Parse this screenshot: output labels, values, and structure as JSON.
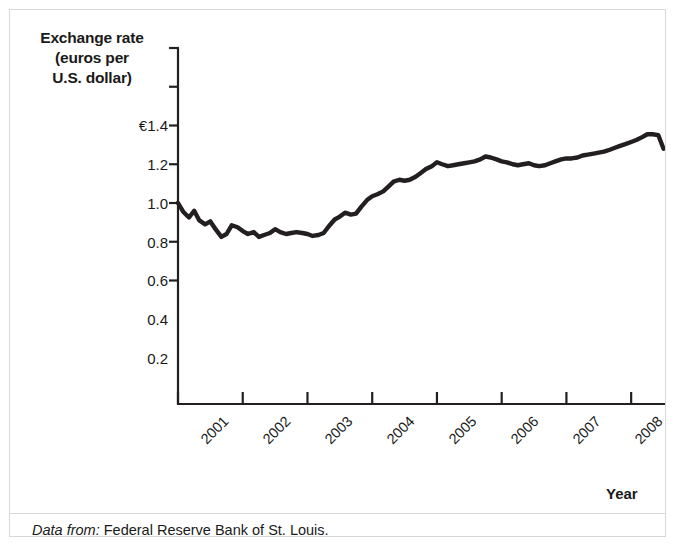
{
  "figure": {
    "y_axis_title_lines": [
      "Exchange rate",
      "(euros per",
      "U.S. dollar)"
    ],
    "x_axis_title": "Year",
    "caption_label": "Data from:",
    "caption_source": "Federal Reserve Bank of St. Louis.",
    "line_color": "#231f20",
    "axis_color": "#231f20",
    "border_color": "#d8d8d8",
    "background_color": "#ffffff"
  },
  "chart_data": {
    "type": "line",
    "title": "",
    "subtitle": "",
    "xlabel": "Year",
    "ylabel": "Exchange rate (euros per U.S. dollar)",
    "xlim": [
      2001.0,
      2008.6
    ],
    "ylim": [
      0.0,
      1.5
    ],
    "grid": false,
    "legend": "none",
    "y_ticks": [
      0.2,
      0.4,
      0.6,
      0.8,
      1.0,
      1.2,
      1.4
    ],
    "y_tick_labels": [
      "0.2",
      "0.4",
      "0.6",
      "0.8",
      "1.0",
      "1.2",
      "€1.4"
    ],
    "x_ticks": [
      2001,
      2002,
      2003,
      2004,
      2005,
      2006,
      2007,
      2008
    ],
    "x_tick_labels": [
      "2001",
      "2002",
      "2003",
      "2004",
      "2005",
      "2006",
      "2007",
      "2008"
    ],
    "series": [
      {
        "name": "Euros per U.S. dollar",
        "x": [
          2001.0,
          2001.08,
          2001.17,
          2001.25,
          2001.33,
          2001.42,
          2001.5,
          2001.58,
          2001.67,
          2001.75,
          2001.83,
          2001.92,
          2002.0,
          2002.08,
          2002.17,
          2002.25,
          2002.33,
          2002.42,
          2002.5,
          2002.58,
          2002.67,
          2002.75,
          2002.83,
          2002.92,
          2003.0,
          2003.08,
          2003.17,
          2003.25,
          2003.33,
          2003.42,
          2003.5,
          2003.58,
          2003.67,
          2003.75,
          2003.83,
          2003.92,
          2004.0,
          2004.08,
          2004.17,
          2004.25,
          2004.33,
          2004.42,
          2004.5,
          2004.58,
          2004.67,
          2004.75,
          2004.83,
          2004.92,
          2005.0,
          2005.08,
          2005.17,
          2005.25,
          2005.33,
          2005.42,
          2005.5,
          2005.58,
          2005.67,
          2005.75,
          2005.83,
          2005.92,
          2006.0,
          2006.08,
          2006.17,
          2006.25,
          2006.33,
          2006.42,
          2006.5,
          2006.58,
          2006.67,
          2006.75,
          2006.83,
          2006.92,
          2007.0,
          2007.08,
          2007.17,
          2007.25,
          2007.33,
          2007.42,
          2007.5,
          2007.58,
          2007.67,
          2007.75,
          2007.83,
          2007.92,
          2008.0,
          2008.08,
          2008.17,
          2008.25,
          2008.33,
          2008.42,
          2008.5
        ],
        "y": [
          1.0,
          1.045,
          1.075,
          1.04,
          1.09,
          1.11,
          1.095,
          1.135,
          1.175,
          1.16,
          1.115,
          1.125,
          1.145,
          1.16,
          1.15,
          1.175,
          1.165,
          1.155,
          1.135,
          1.15,
          1.16,
          1.155,
          1.15,
          1.155,
          1.16,
          1.17,
          1.165,
          1.155,
          1.12,
          1.085,
          1.07,
          1.05,
          1.06,
          1.055,
          1.02,
          0.985,
          0.965,
          0.955,
          0.94,
          0.915,
          0.89,
          0.88,
          0.885,
          0.88,
          0.865,
          0.845,
          0.825,
          0.81,
          0.79,
          0.8,
          0.81,
          0.805,
          0.8,
          0.795,
          0.79,
          0.785,
          0.775,
          0.76,
          0.765,
          0.775,
          0.785,
          0.79,
          0.8,
          0.805,
          0.8,
          0.795,
          0.805,
          0.81,
          0.805,
          0.795,
          0.785,
          0.775,
          0.77,
          0.77,
          0.765,
          0.755,
          0.75,
          0.745,
          0.74,
          0.735,
          0.725,
          0.715,
          0.705,
          0.695,
          0.685,
          0.675,
          0.66,
          0.645,
          0.645,
          0.65,
          0.72
        ]
      }
    ]
  }
}
